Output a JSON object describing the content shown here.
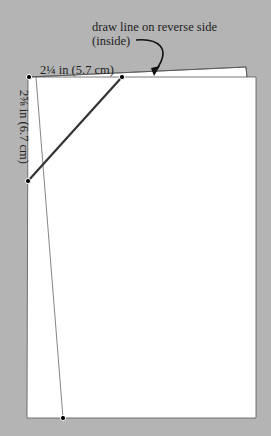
{
  "diagram": {
    "annotation": {
      "line1": "draw line on reverse side",
      "line2": "(inside)"
    },
    "dimension_width": "2¼ in (5.7 cm)",
    "dimension_height": "2⅝ in (6.7 cm)",
    "colors": {
      "background": "#b4b4b4",
      "paper": "#ffffff",
      "line": "#333333",
      "dot": "#000000"
    }
  }
}
